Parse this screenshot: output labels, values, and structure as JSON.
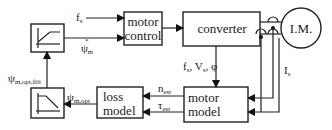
{
  "diagram": {
    "blocks": {
      "ramp_up": {
        "icon": "ramp-up-limiter-icon"
      },
      "motor_control": {
        "line1": "motor",
        "line2": "control"
      },
      "converter": {
        "label": "converter"
      },
      "induction_motor": {
        "label": "I.M."
      },
      "ramp_down": {
        "icon": "ramp-down-filter-icon"
      },
      "loss_model": {
        "line1": "loss",
        "line2": "model"
      },
      "motor_model": {
        "line1": "motor",
        "line2": "model"
      }
    },
    "signals": {
      "fs": {
        "main": "f",
        "sub": "s"
      },
      "psi_m_star": {
        "main": "ψ",
        "sup": "*",
        "sub": "m"
      },
      "fs_vs_phi": {
        "f": "f",
        "f_sub": "s",
        "sep1": ", ",
        "v": "V",
        "v_sub": "s",
        "sep2": ", ",
        "phi": "φ"
      },
      "is": {
        "main": "I",
        "sub": "s"
      },
      "n_est": {
        "main": "n",
        "sub": "est"
      },
      "tau_est": {
        "main": "τ",
        "sub": "est"
      },
      "psi_m_opt": {
        "main": "ψ",
        "sub": "m,opt"
      },
      "psi_m_opt_filt": {
        "main": "ψ",
        "sub": "m,opt,filt"
      }
    },
    "colors": {
      "stroke": "#222222",
      "background": "#ffffff"
    }
  }
}
